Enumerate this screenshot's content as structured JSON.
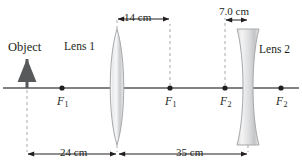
{
  "figure": {
    "type": "optics-ray-diagram",
    "width": 302,
    "height": 168,
    "background": "#ffffff",
    "axis_color": "#58595b",
    "line_color": "#231f20",
    "lens_fill_light": "#f2f2f2",
    "lens_fill_dark": "#b9bbbd"
  },
  "labels": {
    "object": "Object",
    "lens1": "Lens 1",
    "lens2": "Lens 2"
  },
  "focal_points": [
    {
      "name": "f1-left",
      "text": "F",
      "sub": "1",
      "x": 62,
      "y": 88
    },
    {
      "name": "f1-right",
      "text": "F",
      "sub": "1",
      "x": 170,
      "y": 88
    },
    {
      "name": "f2-left",
      "text": "F",
      "sub": "2",
      "x": 225,
      "y": 88
    },
    {
      "name": "f2-right",
      "text": "F",
      "sub": "2",
      "x": 281,
      "y": 88
    }
  ],
  "dimensions": {
    "lens1_to_f1": "14 cm",
    "lens2_focal": "7.0 cm",
    "object_to_lens1": "24 cm",
    "lens1_to_lens2": "35 cm"
  },
  "optical_axis": {
    "y": 88,
    "x_start": 3,
    "x_end": 299
  },
  "elements": {
    "object_arrow": {
      "x": 27,
      "top": 57,
      "bottom": 88
    },
    "lens1": {
      "x": 117,
      "top": 29,
      "bottom": 145,
      "half_width": 8,
      "kind": "converging"
    },
    "lens2": {
      "x": 248,
      "top": 29,
      "bottom": 145,
      "half_width": 11,
      "kind": "diverging"
    }
  }
}
